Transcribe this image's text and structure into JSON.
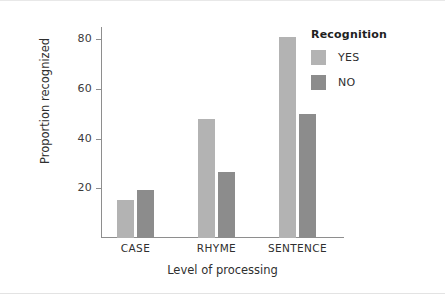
{
  "chart_data": {
    "type": "bar",
    "title": "",
    "xlabel": "Level of processing",
    "ylabel": "Proportion recognized",
    "categories": [
      "CASE",
      "RHYME",
      "SENTENCE"
    ],
    "series": [
      {
        "name": "YES",
        "color": "#b3b3b3",
        "values": [
          15.5,
          48,
          81
        ]
      },
      {
        "name": "NO",
        "color": "#8c8c8c",
        "values": [
          19.5,
          26.5,
          50
        ]
      }
    ],
    "legend": {
      "title": "Recognition",
      "position": "right",
      "entries": [
        "YES",
        "NO"
      ]
    },
    "yticks": [
      20,
      40,
      60,
      80
    ],
    "ytick_labels": [
      "20",
      "40",
      "60",
      "80"
    ],
    "ylim": [
      0,
      85
    ],
    "xlim_categories": 3,
    "grid": false
  },
  "axes": {
    "y_title": "Proportion recognized",
    "x_title": "Level of processing",
    "y_tick_labels": [
      "80",
      "60",
      "40",
      "20"
    ],
    "x_tick_labels": [
      "CASE",
      "RHYME",
      "SENTENCE"
    ]
  },
  "legend": {
    "title": "Recognition",
    "items": [
      {
        "label": "YES",
        "color": "#b3b3b3"
      },
      {
        "label": "NO",
        "color": "#8c8c8c"
      }
    ]
  },
  "colors": {
    "yes_bar": "#b3b3b3",
    "no_bar": "#8c8c8c",
    "axis": "#8e8e8e",
    "text": "#2f2f2f",
    "background": "#ffffff"
  }
}
